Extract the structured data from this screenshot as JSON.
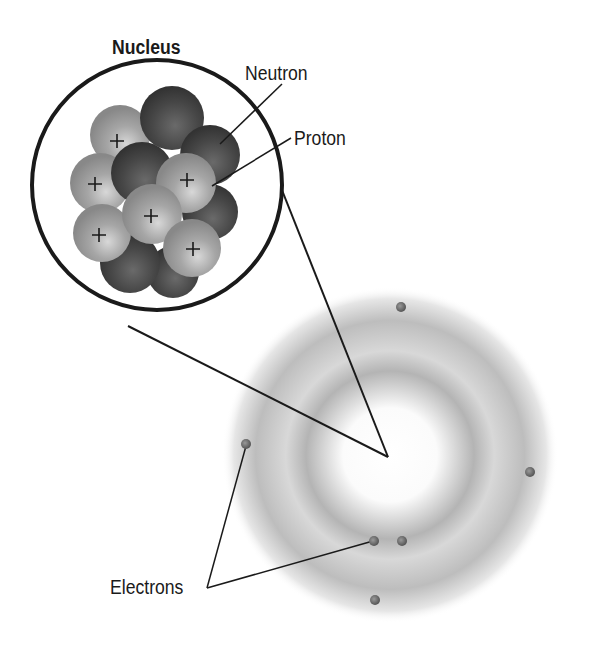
{
  "labels": {
    "nucleus": "Nucleus",
    "neutron": "Neutron",
    "proton": "Proton",
    "electrons": "Electrons"
  },
  "particles": {
    "proton_symbol": "+",
    "proton_count_visible": 7
  },
  "electrons": {
    "count": 6,
    "positions": [
      [
        401,
        307
      ],
      [
        246,
        444
      ],
      [
        530,
        472
      ],
      [
        374,
        541
      ],
      [
        402,
        541
      ],
      [
        375,
        600
      ]
    ]
  },
  "colors": {
    "proton": "#9a9a9a",
    "neutron": "#4a4a4a",
    "electron": "#6a6a6a",
    "cloud": "#bcbcbc",
    "outline": "#1a1a1a"
  }
}
